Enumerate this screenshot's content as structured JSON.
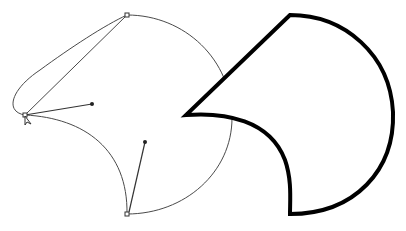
{
  "diagram": {
    "colors": {
      "background": "#ffffff",
      "thin_path": "#4a4a4a",
      "stroke_shape": "#000000"
    },
    "left_path": {
      "anchors": [
        {
          "name": "top-anchor",
          "x": 127,
          "y": 15
        },
        {
          "name": "left-anchor",
          "x": 25,
          "y": 115
        },
        {
          "name": "bottom-anchor",
          "x": 127,
          "y": 214
        }
      ],
      "handles": [
        {
          "from": "left-anchor",
          "to_x": 92,
          "to_y": 104
        },
        {
          "from": "bottom-anchor",
          "to_x": 145,
          "to_y": 142
        }
      ],
      "cursor": {
        "x": 26,
        "y": 116
      }
    },
    "right_shape": {
      "top_x": 290,
      "top_y": 15,
      "point_x": 186,
      "point_y": 115,
      "bottom_x": 290,
      "bottom_y": 214,
      "stroke_width": 4
    }
  }
}
